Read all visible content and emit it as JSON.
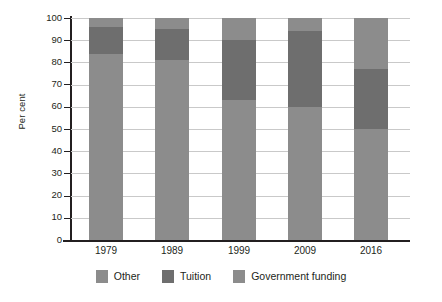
{
  "chart_data": {
    "type": "bar",
    "subtype": "stacked-100-percent",
    "title": "",
    "xlabel": "",
    "ylabel": "Per cent",
    "ylim": [
      0,
      100
    ],
    "ytick_step": 10,
    "yticks": [
      100,
      90,
      80,
      70,
      60,
      50,
      40,
      30,
      20,
      10,
      0
    ],
    "grid": true,
    "grid_axis": "y",
    "legend_position": "bottom",
    "categories": [
      "1979",
      "1989",
      "1999",
      "2009",
      "2016"
    ],
    "series": [
      {
        "name": "Other",
        "color": "#8c8c8c",
        "values": [
          4,
          5,
          10,
          6,
          23
        ]
      },
      {
        "name": "Tuition",
        "color": "#6e6e6e",
        "values": [
          12,
          14,
          27,
          34,
          27
        ]
      },
      {
        "name": "Government funding",
        "color": "#8c8c8c",
        "values": [
          84,
          81,
          63,
          60,
          50
        ]
      }
    ],
    "stack_boundaries_percent": {
      "1979": {
        "other_top": 100,
        "tuition_top": 96,
        "government_top": 84
      },
      "1989": {
        "other_top": 100,
        "tuition_top": 95,
        "government_top": 81
      },
      "1999": {
        "other_top": 100,
        "tuition_top": 90,
        "government_top": 63
      },
      "2009": {
        "other_top": 100,
        "tuition_top": 94,
        "government_top": 60
      },
      "2016": {
        "other_top": 100,
        "tuition_top": 77,
        "government_top": 50
      }
    }
  },
  "axis": {
    "y_title": "Per cent",
    "y_tick_labels": [
      "100",
      "90",
      "80",
      "70",
      "60",
      "50",
      "40",
      "30",
      "20",
      "10",
      "0"
    ],
    "x_tick_labels": [
      "1979",
      "1989",
      "1999",
      "2009",
      "2016"
    ]
  },
  "legend": {
    "items": [
      {
        "label": "Other",
        "color": "#8c8c8c"
      },
      {
        "label": "Tuition",
        "color": "#6e6e6e"
      },
      {
        "label": "Government funding",
        "color": "#8c8c8c"
      }
    ]
  },
  "colors": {
    "light_gray": "#8c8c8c",
    "dark_gray": "#6e6e6e",
    "gridline": "#c9c9c9",
    "axis": "#231f20",
    "text": "#231f20",
    "background": "#ffffff"
  }
}
